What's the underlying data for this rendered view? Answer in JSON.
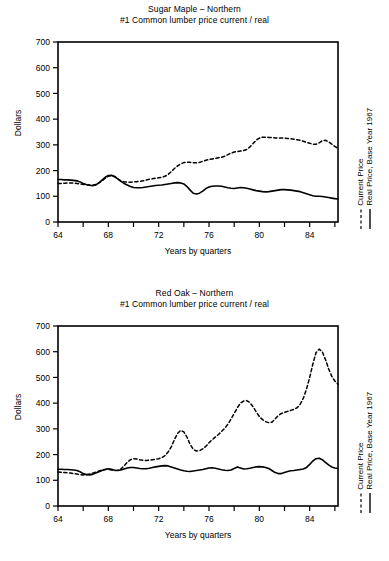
{
  "page": {
    "background": "#ffffff",
    "ink": "#000000"
  },
  "charts": [
    {
      "id": "sugar-maple",
      "title_main": "Sugar Maple – Northern",
      "title_sub": "#1 Common lumber price current / real",
      "ylabel": "Dollars",
      "xlabel": "Years by quarters",
      "legend": [
        {
          "label": "Current Price",
          "style": "dashed"
        },
        {
          "label": "Real Price, Base Year 1967",
          "style": "solid"
        }
      ],
      "yticks": [
        "0",
        "100",
        "200",
        "300",
        "400",
        "500",
        "600",
        "700"
      ],
      "xticks_labeled": [
        "64",
        "68",
        "72",
        "76",
        "80",
        "84"
      ]
    },
    {
      "id": "red-oak",
      "title_main": "Red Oak – Northern",
      "title_sub": "#1 Common lumber price current / real",
      "ylabel": "Dollars",
      "xlabel": "Years by quarters",
      "legend": [
        {
          "label": "Current Price",
          "style": "dashed"
        },
        {
          "label": "Real Price, Base Year 1967",
          "style": "solid"
        }
      ],
      "yticks": [
        "0",
        "100",
        "200",
        "300",
        "400",
        "500",
        "600",
        "700"
      ],
      "xticks_labeled": [
        "64",
        "68",
        "72",
        "76",
        "80",
        "84"
      ]
    }
  ],
  "chart_data": [
    {
      "type": "line",
      "title": "Sugar Maple – Northern / #1 Common lumber price current / real",
      "xlabel": "Years by quarters",
      "ylabel": "Dollars",
      "xlim": [
        1964.0,
        1986.25
      ],
      "ylim": [
        0,
        700
      ],
      "ytick_step": 100,
      "xtick_step_minor": 2,
      "xtick_labels": [
        1964,
        1968,
        1972,
        1976,
        1980,
        1984
      ],
      "grid": false,
      "legend_position": "right-outside-vertical",
      "x": [
        1964.0,
        1964.25,
        1964.5,
        1964.75,
        1965.0,
        1965.25,
        1965.5,
        1965.75,
        1966.0,
        1966.25,
        1966.5,
        1966.75,
        1967.0,
        1967.25,
        1967.5,
        1967.75,
        1968.0,
        1968.25,
        1968.5,
        1968.75,
        1969.0,
        1969.25,
        1969.5,
        1969.75,
        1970.0,
        1970.25,
        1970.5,
        1970.75,
        1971.0,
        1971.25,
        1971.5,
        1971.75,
        1972.0,
        1972.25,
        1972.5,
        1972.75,
        1973.0,
        1973.25,
        1973.5,
        1973.75,
        1974.0,
        1974.25,
        1974.5,
        1974.75,
        1975.0,
        1975.25,
        1975.5,
        1975.75,
        1976.0,
        1976.25,
        1976.5,
        1976.75,
        1977.0,
        1977.25,
        1977.5,
        1977.75,
        1978.0,
        1978.25,
        1978.5,
        1978.75,
        1979.0,
        1979.25,
        1979.5,
        1979.75,
        1980.0,
        1980.25,
        1980.5,
        1980.75,
        1981.0,
        1981.25,
        1981.5,
        1981.75,
        1982.0,
        1982.25,
        1982.5,
        1982.75,
        1983.0,
        1983.25,
        1983.5,
        1983.75,
        1984.0,
        1984.25,
        1984.5,
        1984.75,
        1985.0,
        1985.25,
        1985.5,
        1985.75,
        1986.0,
        1986.25
      ],
      "series": [
        {
          "name": "Current Price",
          "style": "dashed",
          "values": [
            150,
            150,
            151,
            152,
            152,
            152,
            150,
            148,
            146,
            145,
            144,
            143,
            146,
            152,
            160,
            170,
            178,
            180,
            176,
            168,
            160,
            156,
            155,
            155,
            156,
            157,
            158,
            160,
            163,
            166,
            168,
            170,
            172,
            174,
            178,
            185,
            196,
            208,
            218,
            226,
            231,
            233,
            232,
            230,
            230,
            232,
            236,
            240,
            243,
            245,
            247,
            250,
            252,
            256,
            262,
            268,
            272,
            274,
            276,
            278,
            282,
            292,
            305,
            318,
            326,
            330,
            330,
            329,
            328,
            327,
            327,
            327,
            326,
            325,
            324,
            322,
            320,
            318,
            314,
            310,
            306,
            303,
            302,
            308,
            316,
            318,
            312,
            303,
            294,
            286,
            280,
            276
          ]
        },
        {
          "name": "Real Price, Base Year 1967",
          "style": "solid",
          "values": [
            165,
            165,
            164,
            164,
            163,
            162,
            160,
            156,
            150,
            146,
            143,
            141,
            144,
            152,
            163,
            174,
            181,
            182,
            177,
            168,
            158,
            150,
            144,
            138,
            134,
            133,
            133,
            134,
            136,
            138,
            140,
            142,
            143,
            144,
            146,
            148,
            150,
            152,
            153,
            152,
            148,
            138,
            124,
            112,
            109,
            112,
            120,
            130,
            136,
            139,
            140,
            140,
            139,
            136,
            133,
            131,
            130,
            132,
            134,
            133,
            131,
            128,
            125,
            122,
            120,
            118,
            117,
            118,
            120,
            122,
            124,
            126,
            126,
            125,
            124,
            122,
            120,
            118,
            114,
            110,
            106,
            102,
            100,
            100,
            99,
            97,
            95,
            93,
            91,
            90,
            89,
            88
          ]
        }
      ]
    },
    {
      "type": "line",
      "title": "Red Oak – Northern / #1 Common lumber price current / real",
      "xlabel": "Years by quarters",
      "ylabel": "Dollars",
      "xlim": [
        1964.0,
        1986.25
      ],
      "ylim": [
        0,
        700
      ],
      "ytick_step": 100,
      "xtick_step_minor": 2,
      "xtick_labels": [
        1964,
        1968,
        1972,
        1976,
        1980,
        1984
      ],
      "grid": false,
      "legend_position": "right-outside-vertical",
      "x": [
        1964.0,
        1964.25,
        1964.5,
        1964.75,
        1965.0,
        1965.25,
        1965.5,
        1965.75,
        1966.0,
        1966.25,
        1966.5,
        1966.75,
        1967.0,
        1967.25,
        1967.5,
        1967.75,
        1968.0,
        1968.25,
        1968.5,
        1968.75,
        1969.0,
        1969.25,
        1969.5,
        1969.75,
        1970.0,
        1970.25,
        1970.5,
        1970.75,
        1971.0,
        1971.25,
        1971.5,
        1971.75,
        1972.0,
        1972.25,
        1972.5,
        1972.75,
        1973.0,
        1973.25,
        1973.5,
        1973.75,
        1974.0,
        1974.25,
        1974.5,
        1974.75,
        1975.0,
        1975.25,
        1975.5,
        1975.75,
        1976.0,
        1976.25,
        1976.5,
        1976.75,
        1977.0,
        1977.25,
        1977.5,
        1977.75,
        1978.0,
        1978.25,
        1978.5,
        1978.75,
        1979.0,
        1979.25,
        1979.5,
        1979.75,
        1980.0,
        1980.25,
        1980.5,
        1980.75,
        1981.0,
        1981.25,
        1981.5,
        1981.75,
        1982.0,
        1982.25,
        1982.5,
        1982.75,
        1983.0,
        1983.25,
        1983.5,
        1983.75,
        1984.0,
        1984.25,
        1984.5,
        1984.75,
        1985.0,
        1985.25,
        1985.5,
        1985.75,
        1986.0,
        1986.25
      ],
      "series": [
        {
          "name": "Current Price",
          "style": "dashed",
          "values": [
            132,
            131,
            130,
            129,
            128,
            126,
            124,
            122,
            121,
            122,
            124,
            128,
            132,
            136,
            140,
            142,
            143,
            140,
            138,
            139,
            144,
            156,
            170,
            180,
            184,
            183,
            180,
            178,
            177,
            178,
            180,
            182,
            184,
            188,
            196,
            210,
            230,
            258,
            282,
            294,
            288,
            268,
            240,
            220,
            214,
            215,
            222,
            232,
            246,
            258,
            268,
            278,
            290,
            302,
            318,
            338,
            360,
            382,
            400,
            408,
            410,
            402,
            386,
            366,
            348,
            336,
            328,
            324,
            326,
            338,
            352,
            360,
            364,
            368,
            372,
            376,
            382,
            396,
            420,
            455,
            500,
            552,
            596,
            610,
            600,
            570,
            534,
            505,
            486,
            474,
            466,
            462
          ]
        },
        {
          "name": "Real Price, Base Year 1967",
          "style": "solid",
          "values": [
            143,
            143,
            142,
            142,
            141,
            140,
            138,
            133,
            126,
            122,
            121,
            123,
            128,
            133,
            138,
            142,
            145,
            143,
            139,
            138,
            140,
            144,
            148,
            150,
            150,
            148,
            146,
            145,
            145,
            147,
            150,
            152,
            154,
            156,
            157,
            156,
            152,
            148,
            144,
            140,
            137,
            135,
            134,
            136,
            138,
            140,
            142,
            145,
            148,
            149,
            147,
            144,
            141,
            139,
            138,
            140,
            146,
            152,
            148,
            144,
            145,
            147,
            150,
            152,
            153,
            152,
            150,
            146,
            138,
            130,
            126,
            126,
            130,
            134,
            137,
            138,
            140,
            142,
            144,
            150,
            162,
            175,
            184,
            186,
            180,
            170,
            160,
            152,
            148,
            146,
            145,
            144
          ]
        }
      ]
    }
  ]
}
